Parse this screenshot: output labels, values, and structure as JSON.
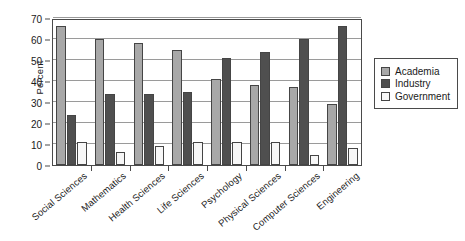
{
  "chart_data": {
    "type": "bar",
    "title": "",
    "xlabel": "",
    "ylabel": "Percent",
    "ylim": [
      0,
      70
    ],
    "yticks": [
      0,
      10,
      20,
      30,
      40,
      50,
      60,
      70
    ],
    "grid": true,
    "legend_position": "right",
    "categories": [
      "Social Sciences",
      "Mathematics",
      "Health Sciences",
      "Life Sciences",
      "Psychology",
      "Physical Sciences",
      "Computer Sciences",
      "Engineering"
    ],
    "series": [
      {
        "name": "Academia",
        "color": "#a8a8a8",
        "values": [
          66,
          60,
          58,
          55,
          41,
          38,
          37,
          29
        ]
      },
      {
        "name": "Industry",
        "color": "#4f4f4f",
        "values": [
          24,
          34,
          34,
          35,
          51,
          54,
          60,
          66
        ]
      },
      {
        "name": "Government",
        "color": "#f7f7f7",
        "values": [
          11,
          6,
          9,
          11,
          11,
          11,
          5,
          8
        ]
      }
    ]
  },
  "axis": {
    "y_label": "Percent"
  },
  "legend": {
    "items": [
      {
        "label": "Academia",
        "color": "#a8a8a8"
      },
      {
        "label": "Industry",
        "color": "#4f4f4f"
      },
      {
        "label": "Government",
        "color": "#f7f7f7"
      }
    ]
  }
}
